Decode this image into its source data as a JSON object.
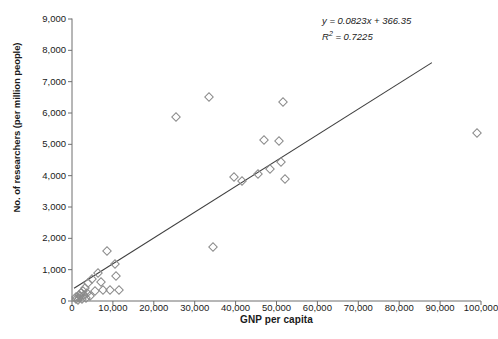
{
  "chart_data": {
    "type": "scatter",
    "title": "",
    "xlabel": "GNP per capita",
    "ylabel": "No. of researchers (per million people)",
    "xlim": [
      0,
      100000
    ],
    "ylim": [
      0,
      9000
    ],
    "xticks": [
      0,
      10000,
      20000,
      30000,
      40000,
      50000,
      60000,
      70000,
      80000,
      90000,
      100000
    ],
    "xticklabels": [
      "0",
      "10,000",
      "20,000",
      "30,000",
      "40,000",
      "50,000",
      "60,000",
      "70,000",
      "80,000",
      "90,000",
      "100,000"
    ],
    "yticks": [
      0,
      1000,
      2000,
      3000,
      4000,
      5000,
      6000,
      7000,
      8000,
      9000
    ],
    "yticklabels": [
      "0",
      "1,000",
      "2,000",
      "3,000",
      "4,000",
      "5,000",
      "6,000",
      "7,000",
      "8,000",
      "9,000"
    ],
    "grid": false,
    "legend": "none",
    "marker_style": "open-diamond",
    "marker_color": "#8a8a8a",
    "line_color": "#3f3f3f",
    "points": [
      {
        "x": 900,
        "y": 70
      },
      {
        "x": 1100,
        "y": 120
      },
      {
        "x": 1400,
        "y": 40
      },
      {
        "x": 1600,
        "y": 200
      },
      {
        "x": 1800,
        "y": 90
      },
      {
        "x": 2000,
        "y": 150
      },
      {
        "x": 2200,
        "y": 260
      },
      {
        "x": 2400,
        "y": 60
      },
      {
        "x": 2600,
        "y": 330
      },
      {
        "x": 2900,
        "y": 180
      },
      {
        "x": 3100,
        "y": 420
      },
      {
        "x": 3400,
        "y": 110
      },
      {
        "x": 3700,
        "y": 250
      },
      {
        "x": 4000,
        "y": 560
      },
      {
        "x": 4300,
        "y": 150
      },
      {
        "x": 4800,
        "y": 700
      },
      {
        "x": 5600,
        "y": 330
      },
      {
        "x": 6400,
        "y": 900
      },
      {
        "x": 7000,
        "y": 620
      },
      {
        "x": 7600,
        "y": 350
      },
      {
        "x": 8600,
        "y": 1580
      },
      {
        "x": 9400,
        "y": 360
      },
      {
        "x": 10400,
        "y": 1180
      },
      {
        "x": 10800,
        "y": 800
      },
      {
        "x": 11600,
        "y": 360
      },
      {
        "x": 25500,
        "y": 5870
      },
      {
        "x": 33500,
        "y": 6520
      },
      {
        "x": 34500,
        "y": 1720
      },
      {
        "x": 39500,
        "y": 3960
      },
      {
        "x": 41500,
        "y": 3820
      },
      {
        "x": 45500,
        "y": 4060
      },
      {
        "x": 47000,
        "y": 5150
      },
      {
        "x": 48500,
        "y": 4210
      },
      {
        "x": 50500,
        "y": 5100
      },
      {
        "x": 51000,
        "y": 4450
      },
      {
        "x": 51500,
        "y": 6350
      },
      {
        "x": 52000,
        "y": 3900
      },
      {
        "x": 99000,
        "y": 5350
      }
    ],
    "trendline": {
      "equation": "y = 0.0823x + 366.35",
      "slope": 0.0823,
      "intercept": 366.35,
      "r_squared_label": "R",
      "r_squared_exponent": "2",
      "r_squared_value": " = 0.7225",
      "r_squared": 0.7225,
      "x_start": 500,
      "x_end": 88000
    }
  },
  "annotation": {
    "equation": "y = 0.0823x + 366.35",
    "r_label": "R",
    "r_sup": "2",
    "r_value": " = 0.7225"
  },
  "caption": {
    "text": ""
  }
}
